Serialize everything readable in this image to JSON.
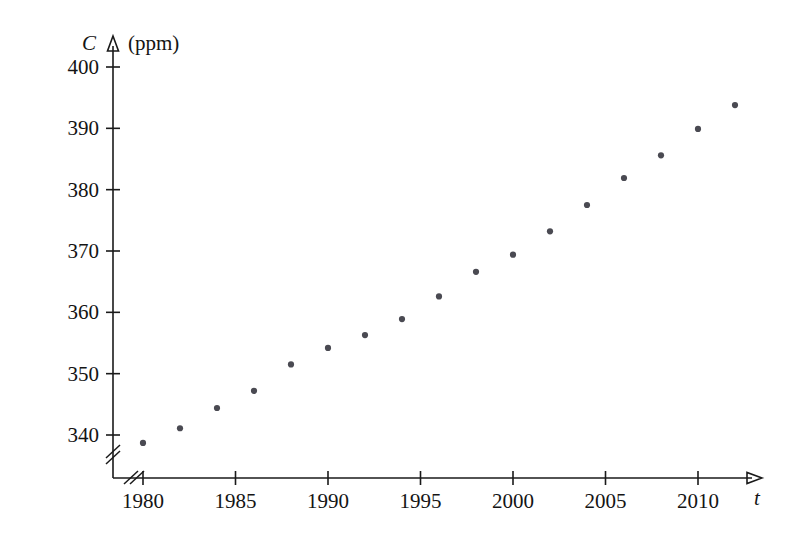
{
  "chart_data": {
    "type": "scatter",
    "title": "",
    "xlabel": "t",
    "ylabel": "C",
    "yunit": "(ppm)",
    "x": [
      1980,
      1982,
      1984,
      1986,
      1988,
      1990,
      1992,
      1994,
      1996,
      1998,
      2000,
      2002,
      2004,
      2006,
      2008,
      2010,
      2012
    ],
    "values": [
      338.7,
      341.1,
      344.4,
      347.2,
      351.5,
      354.2,
      356.3,
      358.9,
      362.6,
      366.6,
      369.4,
      373.2,
      377.5,
      381.9,
      385.6,
      389.9,
      393.8
    ],
    "xlim": [
      1978.5,
      2013.5
    ],
    "ylim": [
      336.0,
      402.0
    ],
    "xticks": [
      1980,
      1985,
      1990,
      1995,
      2000,
      2005,
      2010
    ],
    "xticklabels": [
      "1980",
      "1985",
      "1990",
      "1995",
      "2000",
      "2005",
      "2010"
    ],
    "yticks": [
      340,
      350,
      360,
      370,
      380,
      390,
      400
    ],
    "yticklabels": [
      "340",
      "350",
      "360",
      "370",
      "380",
      "390",
      "400"
    ],
    "grid": false,
    "legend": null,
    "axis_break_x": true,
    "axis_break_y": true,
    "marker_color": "#4a4a52",
    "axis_color": "#1a1a1a",
    "background_color": "#ffffff"
  }
}
